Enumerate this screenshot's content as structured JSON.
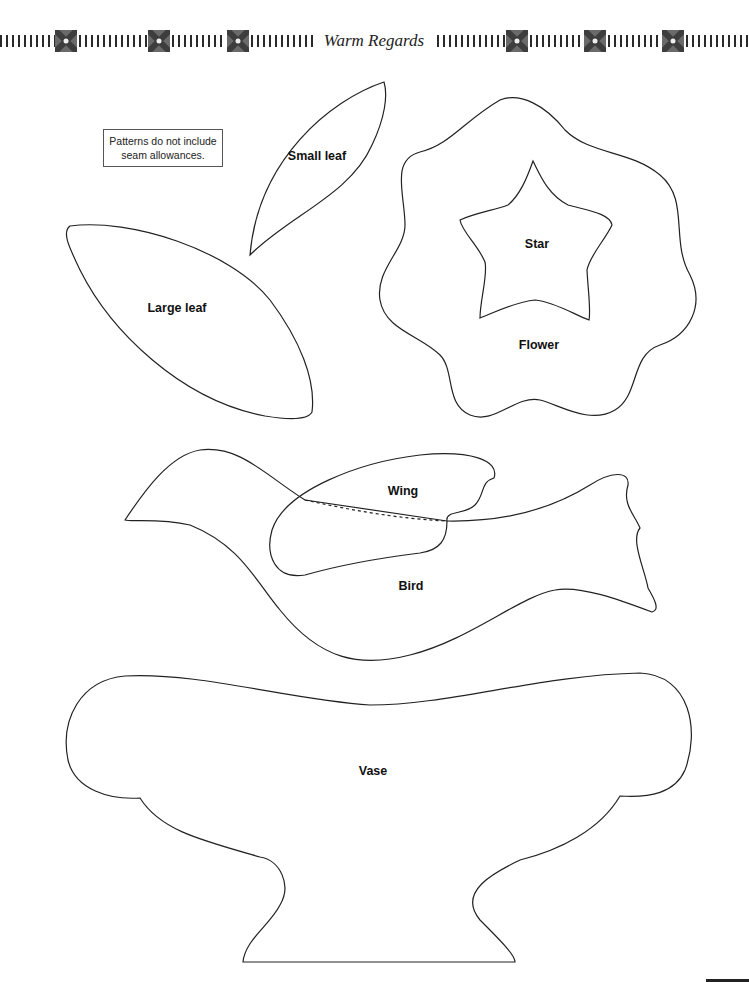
{
  "header": {
    "title": "Warm Regards",
    "ornament_icon": "quilt-block-square-icon",
    "ornament_color": "#6a6a6a"
  },
  "note": {
    "text_line1": "Patterns do not include",
    "text_line2": "seam allowances."
  },
  "patterns": [
    {
      "id": "small-leaf",
      "label": "Small leaf"
    },
    {
      "id": "large-leaf",
      "label": "Large leaf"
    },
    {
      "id": "star",
      "label": "Star"
    },
    {
      "id": "flower",
      "label": "Flower"
    },
    {
      "id": "wing",
      "label": "Wing"
    },
    {
      "id": "bird",
      "label": "Bird"
    },
    {
      "id": "vase",
      "label": "Vase"
    }
  ],
  "colors": {
    "outline": "#222222",
    "background": "#ffffff"
  }
}
